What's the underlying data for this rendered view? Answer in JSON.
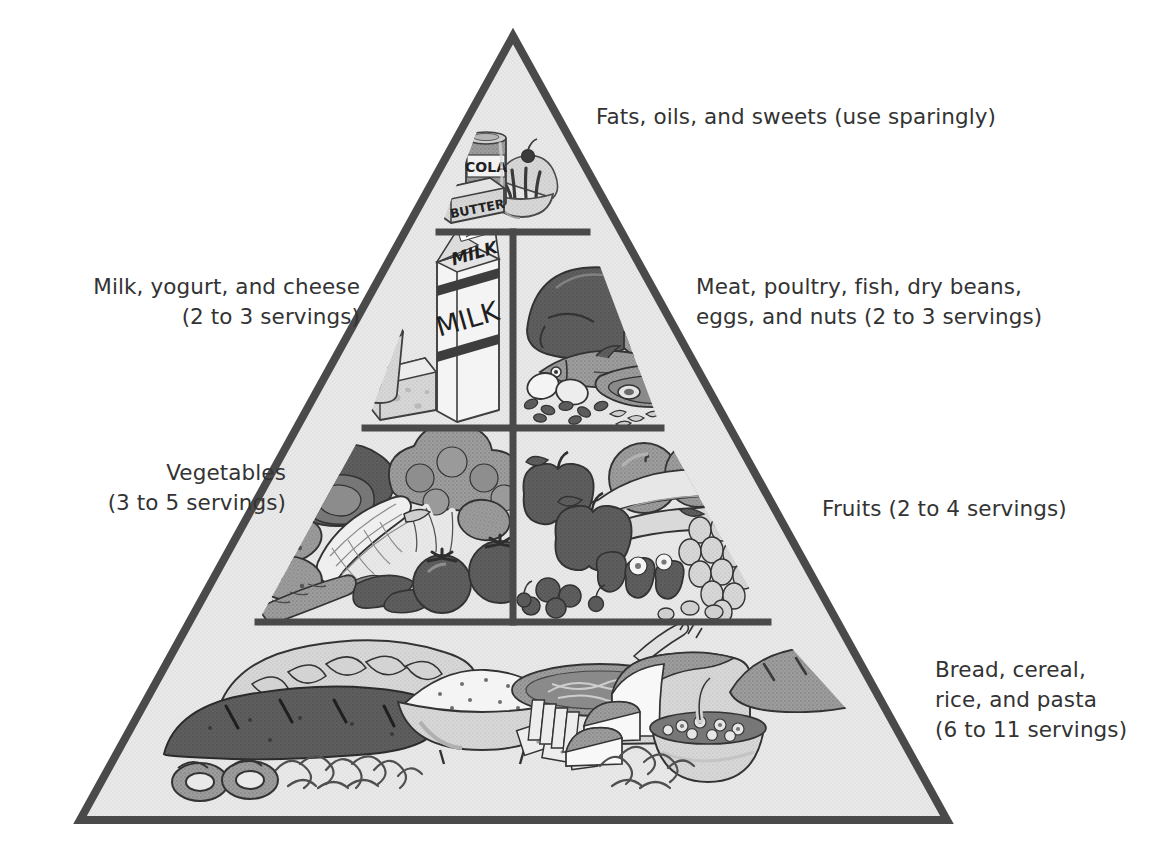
{
  "diagram": {
    "kind": "food-guide-pyramid",
    "tiers": [
      {
        "id": "fats",
        "label": "Fats, oils, and sweets (use sparingly)",
        "side": "right",
        "servings": "use sparingly",
        "foods": [
          "cola can",
          "butter box",
          "ice cream sundae with cherry"
        ]
      },
      {
        "id": "milk",
        "label": "Milk, yogurt, and cheese\n(2 to 3 servings)",
        "side": "left",
        "servings": "2 to 3 servings",
        "foods": [
          "milk carton",
          "yogurt cup with spoon",
          "swiss cheese wedge"
        ]
      },
      {
        "id": "meat",
        "label": "Meat, poultry, fish, dry beans,\neggs, and nuts (2 to 3 servings)",
        "side": "right",
        "servings": "2 to 3 servings",
        "foods": [
          "roast turkey",
          "fish",
          "eggs",
          "steak",
          "beans",
          "nuts"
        ]
      },
      {
        "id": "vegetables",
        "label": "Vegetables\n(3 to 5 servings)",
        "side": "left",
        "servings": "3 to 5 servings",
        "foods": [
          "lettuce",
          "broccoli",
          "corn",
          "potatoes",
          "carrot",
          "tomatoes",
          "greens"
        ]
      },
      {
        "id": "fruits",
        "label": "Fruits (2 to 4 servings)",
        "side": "right",
        "servings": "2 to 4 servings",
        "foods": [
          "apples",
          "oranges",
          "bananas",
          "grapes",
          "strawberries",
          "berries",
          "cherries"
        ]
      },
      {
        "id": "bread",
        "label": "Bread, cereal,\nrice, and pasta\n(6 to 11 servings)",
        "side": "right",
        "servings": "6 to 11 servings",
        "foods": [
          "braided bread",
          "rye loaf",
          "pretzels",
          "bowl of rice",
          "spaghetti",
          "crackers",
          "sliced bread loaf",
          "baguette",
          "bowl of cereal",
          "noodles"
        ]
      }
    ],
    "package_text": {
      "cola": "COLA",
      "butter": "BUTTER",
      "milk_top": "MILK",
      "milk_front": "MILK"
    },
    "colors": {
      "outline": "#4a4a4a",
      "fill": "#e9e9e9",
      "text": "#333333",
      "mid_gray": "#9a9a9a",
      "dark_gray": "#6a6a6a",
      "darkest_gray": "#4f4f4f",
      "light_gray": "#cfcfcf",
      "white": "#f7f7f7"
    }
  }
}
